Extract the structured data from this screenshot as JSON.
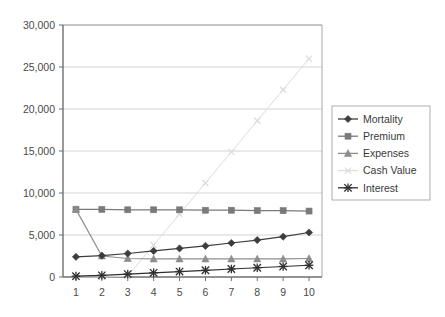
{
  "chart_data": {
    "type": "line",
    "title": "",
    "xlabel": "",
    "ylabel": "",
    "x": [
      1,
      2,
      3,
      4,
      5,
      6,
      7,
      8,
      9,
      10
    ],
    "xtick_labels": [
      "1",
      "2",
      "3",
      "4",
      "5",
      "6",
      "7",
      "8",
      "9",
      "10"
    ],
    "ytick_labels": [
      "0",
      "5,000",
      "10,000",
      "15,000",
      "20,000",
      "25,000",
      "30,000"
    ],
    "ytick_values": [
      0,
      5000,
      10000,
      15000,
      20000,
      25000,
      30000
    ],
    "ylim": [
      0,
      30000
    ],
    "xlim": [
      0.5,
      10.5
    ],
    "grid": "horizontal",
    "legend_position": "right",
    "series": [
      {
        "name": "Mortality",
        "marker": "diamond",
        "color": "#3d3d3d",
        "values": [
          2400,
          2550,
          2800,
          3100,
          3400,
          3700,
          4050,
          4400,
          4800,
          5300
        ]
      },
      {
        "name": "Premium",
        "marker": "square",
        "color": "#7a7a7a",
        "values": [
          8050,
          8050,
          8000,
          8000,
          8000,
          7950,
          7950,
          7900,
          7900,
          7850
        ]
      },
      {
        "name": "Expenses",
        "marker": "triangle",
        "color": "#8d8d8d",
        "values": [
          8050,
          2500,
          2200,
          2150,
          2150,
          2150,
          2150,
          2150,
          2150,
          2200
        ]
      },
      {
        "name": "Cash Value",
        "marker": "x",
        "color": "#dcdcdc",
        "values": [
          0,
          0,
          100,
          3800,
          7500,
          11200,
          14900,
          18600,
          22300,
          26000
        ]
      },
      {
        "name": "Interest",
        "marker": "star",
        "color": "#2f2f2f",
        "values": [
          100,
          200,
          350,
          500,
          650,
          800,
          950,
          1100,
          1250,
          1400
        ]
      }
    ]
  }
}
